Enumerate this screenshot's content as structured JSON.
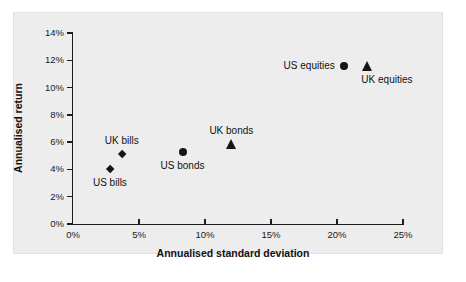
{
  "chart_data": {
    "type": "scatter",
    "title": "",
    "xlabel": "Annualised standard deviation",
    "ylabel": "Annualised return",
    "xlim": [
      0,
      25
    ],
    "ylim": [
      0,
      14
    ],
    "xticks": [
      "0%",
      "5%",
      "10%",
      "15%",
      "20%",
      "25%"
    ],
    "xtick_values": [
      0,
      5,
      10,
      15,
      20,
      25
    ],
    "yticks": [
      "0%",
      "2%",
      "4%",
      "6%",
      "8%",
      "10%",
      "12%",
      "14%"
    ],
    "ytick_values": [
      0,
      2,
      4,
      6,
      8,
      10,
      12,
      14
    ],
    "grid": false,
    "legend": "none",
    "points": [
      {
        "label": "US bills",
        "x": 2.8,
        "y": 4.0,
        "marker": "diamond",
        "label_pos": "below"
      },
      {
        "label": "UK bills",
        "x": 3.7,
        "y": 5.1,
        "marker": "diamond",
        "label_pos": "above"
      },
      {
        "label": "US bonds",
        "x": 8.3,
        "y": 5.3,
        "marker": "circle",
        "label_pos": "below"
      },
      {
        "label": "UK bonds",
        "x": 12.0,
        "y": 5.9,
        "marker": "triangle",
        "label_pos": "above"
      },
      {
        "label": "US equities",
        "x": 20.5,
        "y": 11.6,
        "marker": "circle",
        "label_pos": "left"
      },
      {
        "label": "UK equities",
        "x": 22.3,
        "y": 11.6,
        "marker": "triangle",
        "label_pos": "below-right"
      }
    ]
  },
  "colors": {
    "marker": "#151515",
    "axis": "#1b1b1b",
    "panel_background": "#ededed",
    "page_background": "#ffffff",
    "text": "#111111"
  }
}
